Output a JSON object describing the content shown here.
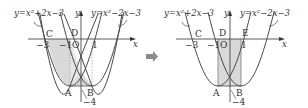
{
  "left_figure": {
    "curve_left_equation": "y=x²+2x−3",
    "curve_right_equation": "y=x²−2x−3",
    "axis_x_label": "x",
    "axis_y_label": "y",
    "origin_label": "O",
    "tick_labels": {
      "neg3": "−3",
      "neg1": "−1",
      "pos1": "1",
      "neg4": "−4"
    },
    "points": {
      "A": "A",
      "B": "B",
      "C": "C",
      "D": "D"
    }
  },
  "arrow": {
    "icon": "arrow-right-icon"
  },
  "right_figure": {
    "curve_left_equation": "y=x²+2x−3",
    "curve_right_equation": "y=x²−2x−3",
    "axis_x_label": "x",
    "axis_y_label": "y",
    "origin_label": "O",
    "tick_labels": {
      "neg3": "−3",
      "neg1": "−1",
      "pos1": "1",
      "neg4": "−4"
    },
    "points": {
      "A": "A",
      "B": "B",
      "C": "C",
      "D": "D",
      "E": "E"
    }
  },
  "colors": {
    "curve": "#4a4a4a",
    "shade": "#d9d9d9",
    "axis": "#333333",
    "dashed": "#9a9a9a",
    "arrow": "#8c8c8c"
  }
}
